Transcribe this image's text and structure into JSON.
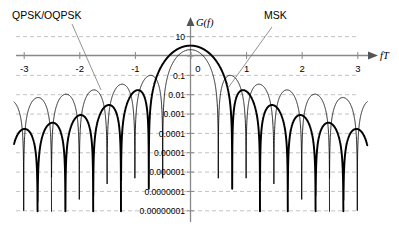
{
  "figure": {
    "background": "#ffffff",
    "axis_color": "#808080",
    "grid_color": "#b4b4b4",
    "curve_color": "#000000"
  },
  "annotations": {
    "qpsk_label": "QPSK/OQPSK",
    "msk_label": "MSK",
    "y_axis_name": "G(f)",
    "x_axis_name": "fT"
  },
  "chart_data": {
    "type": "line",
    "title": "",
    "subtitle": "",
    "xlabel": "fT",
    "ylabel": "G(f)",
    "xlim": [
      -3.2,
      3.2
    ],
    "ylim": [
      1e-08,
      30
    ],
    "yscale": "log",
    "grid": true,
    "legend_position": "inline-annotations",
    "x_ticks": [
      -3,
      -2,
      -1,
      0,
      1,
      2,
      3
    ],
    "x_tick_labels": [
      "-3",
      "-2",
      "-1",
      "0",
      "1",
      "2",
      "3"
    ],
    "y_ticks": [
      10,
      1,
      0.1,
      0.01,
      0.001,
      0.0001,
      1e-05,
      1e-06,
      1e-07,
      1e-08
    ],
    "y_tick_labels": [
      "10",
      "",
      "0.1",
      "0.01",
      "0.001",
      "0.0001",
      "0.00001",
      "0.000001",
      "0.0000001",
      "0.00000001"
    ],
    "series": [
      {
        "name": "QPSK/OQPSK",
        "style": "thin",
        "linewidth": 0.8,
        "formula": "2*(sinc(2*f*T))^2",
        "nulls_at": [
          -3.0,
          -2.5,
          -2.0,
          -1.5,
          -1.0,
          -0.5,
          0.5,
          1.0,
          1.5,
          2.0,
          2.5,
          3.0
        ],
        "peak_value": 2.0,
        "sidelobe_peaks": [
          0.09,
          0.032,
          0.016,
          0.01,
          0.0069,
          0.005
        ]
      },
      {
        "name": "MSK",
        "style": "thick",
        "linewidth": 1.9,
        "formula": "(32/pi^2)*(cos(2*pi*f*T)/(1-16*f^2*T^2))^2",
        "nulls_at": [
          -2.75,
          -2.25,
          -1.75,
          -1.25,
          -0.75,
          0.75,
          1.25,
          1.75,
          2.25,
          2.75
        ],
        "peak_value": 3.24,
        "sidelobe_peaks": [
          0.0012,
          0.00011,
          2.8e-05,
          9.6e-06,
          4.2e-06
        ]
      }
    ]
  }
}
